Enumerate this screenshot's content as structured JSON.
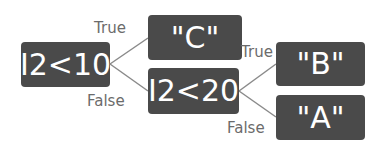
{
  "diagram": {
    "nodes": {
      "root": {
        "label": "I2<10"
      },
      "c": {
        "label": "\"C\""
      },
      "mid": {
        "label": "I2<20"
      },
      "b": {
        "label": "\"B\""
      },
      "a": {
        "label": "\"A\""
      }
    },
    "edges": {
      "root_true": {
        "label": "True"
      },
      "root_false": {
        "label": "False"
      },
      "mid_true": {
        "label": "True"
      },
      "mid_false": {
        "label": "False"
      }
    },
    "colors": {
      "node_fill": "#4a4a4a",
      "node_text": "#ffffff",
      "edge": "#888888",
      "edge_label": "#6b6b6b"
    }
  }
}
